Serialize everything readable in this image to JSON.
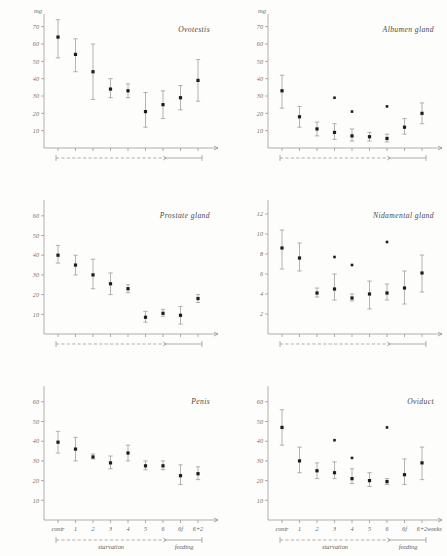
{
  "figure": {
    "unit_label": "mg",
    "week_axis_label": "weeks",
    "phases": {
      "starvation": "starvation",
      "feeding": "feeding"
    },
    "categories": [
      "contr",
      "1",
      "2",
      "3",
      "4",
      "5",
      "6",
      "6f",
      "6+2"
    ]
  },
  "chart_data": [
    {
      "type": "scatter",
      "title": "Ovotestis",
      "panel": "top-left",
      "xlabel": "",
      "ylabel": "mg",
      "ylim": [
        0,
        75
      ],
      "yticks": [
        10,
        20,
        30,
        40,
        50,
        60,
        70
      ],
      "grid": false,
      "show_xticklabels": false,
      "categories": [
        "contr",
        "1",
        "2",
        "3",
        "4",
        "5",
        "6",
        "6f",
        "6+2"
      ],
      "values": [
        64,
        54,
        44,
        34,
        33,
        21,
        25,
        29,
        39
      ],
      "err_low": [
        52,
        44,
        28,
        29,
        29,
        12,
        17,
        22,
        27
      ],
      "err_high": [
        74,
        63,
        60,
        40,
        37,
        32,
        33,
        36,
        51
      ],
      "outliers": []
    },
    {
      "type": "scatter",
      "title": "Albumen gland",
      "panel": "top-right",
      "xlabel": "",
      "ylabel": "mg",
      "ylim": [
        0,
        75
      ],
      "yticks": [
        10,
        20,
        30,
        40,
        50,
        60,
        70
      ],
      "grid": false,
      "show_xticklabels": false,
      "categories": [
        "contr",
        "1",
        "2",
        "3",
        "4",
        "5",
        "6",
        "6f",
        "6+2"
      ],
      "values": [
        33,
        18,
        11,
        9,
        7,
        6.5,
        5.5,
        12,
        20
      ],
      "err_low": [
        23,
        12,
        7,
        5,
        4,
        4,
        3.5,
        8,
        14
      ],
      "err_high": [
        42,
        24,
        15,
        14,
        11,
        9,
        8,
        17,
        26
      ],
      "outliers": [
        {
          "category": "3",
          "value": 29
        },
        {
          "category": "4",
          "value": 21
        },
        {
          "category": "6",
          "value": 24
        }
      ]
    },
    {
      "type": "scatter",
      "title": "Prostate gland",
      "panel": "middle-left",
      "xlabel": "",
      "ylabel": "",
      "ylim": [
        0,
        66
      ],
      "yticks": [
        10,
        20,
        30,
        40,
        50,
        60
      ],
      "grid": false,
      "show_xticklabels": false,
      "categories": [
        "contr",
        "1",
        "2",
        "3",
        "4",
        "5",
        "6",
        "6f",
        "6+2"
      ],
      "values": [
        40,
        35,
        30,
        25.5,
        23,
        8.5,
        10.5,
        9.5,
        18
      ],
      "err_low": [
        36,
        30,
        23,
        20,
        21,
        6,
        9,
        5,
        16
      ],
      "err_high": [
        45,
        40,
        38,
        31,
        25,
        11.5,
        12.5,
        14,
        20
      ],
      "outliers": []
    },
    {
      "type": "scatter",
      "title": "Nidamental gland",
      "panel": "middle-right",
      "xlabel": "",
      "ylabel": "",
      "ylim": [
        0,
        13
      ],
      "yticks": [
        2,
        4,
        6,
        8,
        10,
        12
      ],
      "grid": false,
      "show_xticklabels": false,
      "categories": [
        "contr",
        "1",
        "2",
        "3",
        "4",
        "5",
        "6",
        "6f",
        "6+2"
      ],
      "values": [
        8.6,
        7.6,
        4.1,
        4.5,
        3.6,
        4.0,
        4.1,
        4.6,
        6.1
      ],
      "err_low": [
        6.5,
        6.3,
        3.7,
        3.4,
        3.3,
        2.5,
        3.4,
        3.0,
        4.2
      ],
      "err_high": [
        10.4,
        9.1,
        4.6,
        6.0,
        4.0,
        5.3,
        5.0,
        6.3,
        7.9
      ],
      "outliers": [
        {
          "category": "3",
          "value": 7.7
        },
        {
          "category": "4",
          "value": 6.9
        },
        {
          "category": "6",
          "value": 9.2
        }
      ]
    },
    {
      "type": "scatter",
      "title": "Penis",
      "panel": "bottom-left",
      "xlabel": "",
      "ylabel": "",
      "ylim": [
        0,
        66
      ],
      "yticks": [
        10,
        20,
        30,
        40,
        50,
        60
      ],
      "grid": false,
      "show_xticklabels": true,
      "categories": [
        "contr",
        "1",
        "2",
        "3",
        "4",
        "5",
        "6",
        "6f",
        "6+2"
      ],
      "values": [
        39.5,
        36,
        32,
        29,
        34,
        27.5,
        27.5,
        22.5,
        23.5
      ],
      "err_low": [
        34,
        30,
        31,
        26,
        30,
        25.5,
        25.5,
        18,
        20.5
      ],
      "err_high": [
        45,
        42,
        33.5,
        32.5,
        38,
        30,
        30,
        28,
        27
      ],
      "outliers": []
    },
    {
      "type": "scatter",
      "title": "Oviduct",
      "panel": "bottom-right",
      "xlabel": "",
      "ylabel": "",
      "ylim": [
        0,
        66
      ],
      "yticks": [
        10,
        20,
        30,
        40,
        50,
        60
      ],
      "grid": false,
      "show_xticklabels": true,
      "categories": [
        "contr",
        "1",
        "2",
        "3",
        "4",
        "5",
        "6",
        "6f",
        "6+2"
      ],
      "values": [
        47,
        30,
        25,
        24,
        21,
        20,
        19.5,
        23,
        29
      ],
      "err_low": [
        38,
        24,
        21,
        21,
        18.5,
        17,
        18,
        18,
        20.5
      ],
      "err_high": [
        56,
        37,
        29,
        29.5,
        26,
        24,
        21,
        31,
        37
      ],
      "outliers": [
        {
          "category": "3",
          "value": 40.5
        },
        {
          "category": "4",
          "value": 31.5
        },
        {
          "category": "6",
          "value": 47
        }
      ]
    }
  ]
}
